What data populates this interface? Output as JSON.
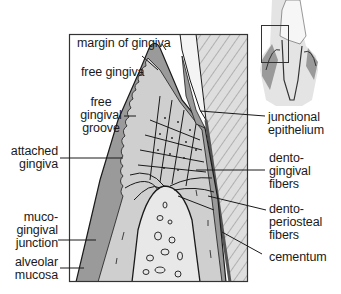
{
  "diagram": {
    "colors": {
      "gingiva_dark": "#9a9a9a",
      "gingiva_light": "#cfcfcf",
      "bone": "#e6e6e6",
      "tooth": "#dcdcdc",
      "enamel_space": "#f2f2f2",
      "line": "#1a1a1a",
      "frame": "#333333"
    },
    "labels": {
      "margin_of_gingiva": "margin of gingiva",
      "free_gingiva": "free gingiva",
      "free_gingival_groove": "free\ngingival\ngroove",
      "attached_gingiva": "attached\ngingiva",
      "mucogingival_junction": "muco-\ngingival\njunction",
      "alveolar_mucosa": "alveolar\nmucosa",
      "junctional_epithelium": "junctional\nepithelium",
      "dentogingival_fibers": "dento-\ngingival\nfibers",
      "dentoperiosteal_fibers": "dento-\nperiosteal\nfibers",
      "cementum": "cementum"
    },
    "inset": {
      "description": "tooth overview with highlighted region box"
    }
  }
}
